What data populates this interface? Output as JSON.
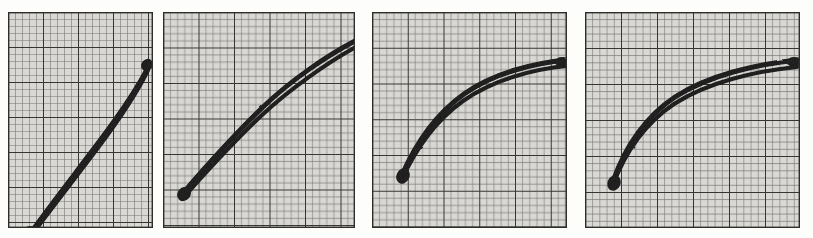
{
  "figure": {
    "title": "",
    "canvas": {
      "width": 813,
      "height": 238
    },
    "background_color": "#fdfdfc",
    "panel_count": 4,
    "ink_color": "#111111",
    "grid_minor_color": "#7c7b77",
    "grid_major_color": "#353431",
    "paper_color": "#d8d7d3"
  },
  "chart_data": {
    "type": "line",
    "title": "",
    "subtitle": "",
    "xlabel": "",
    "ylabel": "",
    "grid": true,
    "legend_position": "none",
    "panels": [
      {
        "index": 1,
        "label": "",
        "xlim": [
          0,
          1
        ],
        "ylim": [
          0,
          1
        ],
        "grid_minor_cells_x": 20,
        "grid_minor_cells_y": 30,
        "grid_major_every": 5,
        "series": [
          {
            "name": "upper",
            "x": [
              0.1,
              0.22,
              0.34,
              0.46,
              0.58,
              0.7,
              0.82,
              0.92
            ],
            "y": [
              0.05,
              0.19,
              0.33,
              0.46,
              0.59,
              0.71,
              0.81,
              0.88
            ]
          },
          {
            "name": "lower",
            "x": [
              0.1,
              0.22,
              0.34,
              0.46,
              0.58,
              0.7,
              0.82,
              0.92
            ],
            "y": [
              0.02,
              0.15,
              0.29,
              0.42,
              0.55,
              0.67,
              0.78,
              0.86
            ]
          }
        ]
      },
      {
        "index": 2,
        "label": "",
        "xlim": [
          0,
          1
        ],
        "ylim": [
          0,
          1
        ],
        "grid_minor_cells_x": 27,
        "grid_minor_cells_y": 30,
        "grid_major_every": 5,
        "series": [
          {
            "name": "upper",
            "x": [
              0.1,
              0.22,
              0.34,
              0.46,
              0.58,
              0.72,
              0.86,
              0.98
            ],
            "y": [
              0.12,
              0.28,
              0.43,
              0.57,
              0.69,
              0.8,
              0.88,
              0.93
            ]
          },
          {
            "name": "lower",
            "x": [
              0.1,
              0.22,
              0.34,
              0.46,
              0.58,
              0.72,
              0.86,
              0.98
            ],
            "y": [
              0.09,
              0.24,
              0.39,
              0.53,
              0.65,
              0.76,
              0.85,
              0.91
            ]
          }
        ]
      },
      {
        "index": 3,
        "label": "",
        "xlim": [
          0,
          1
        ],
        "ylim": [
          0,
          1
        ],
        "grid_minor_cells_x": 27,
        "grid_minor_cells_y": 30,
        "grid_major_every": 5,
        "series": [
          {
            "name": "upper",
            "x": [
              0.14,
              0.25,
              0.36,
              0.48,
              0.6,
              0.74,
              0.88,
              1.0
            ],
            "y": [
              0.26,
              0.44,
              0.58,
              0.69,
              0.76,
              0.81,
              0.84,
              0.85
            ]
          },
          {
            "name": "lower",
            "x": [
              0.14,
              0.25,
              0.36,
              0.48,
              0.6,
              0.74,
              0.88,
              1.0
            ],
            "y": [
              0.22,
              0.39,
              0.53,
              0.65,
              0.73,
              0.78,
              0.82,
              0.84
            ]
          }
        ]
      },
      {
        "index": 4,
        "label": "",
        "xlim": [
          0,
          1
        ],
        "ylim": [
          0,
          1
        ],
        "grid_minor_cells_x": 30,
        "grid_minor_cells_y": 30,
        "grid_major_every": 5,
        "series": [
          {
            "name": "upper",
            "x": [
              0.12,
              0.22,
              0.32,
              0.44,
              0.58,
              0.72,
              0.86,
              0.99
            ],
            "y": [
              0.24,
              0.45,
              0.6,
              0.71,
              0.79,
              0.84,
              0.87,
              0.89
            ]
          },
          {
            "name": "lower",
            "x": [
              0.12,
              0.22,
              0.32,
              0.44,
              0.58,
              0.72,
              0.86,
              0.99
            ],
            "y": [
              0.2,
              0.4,
              0.55,
              0.67,
              0.76,
              0.82,
              0.85,
              0.87
            ]
          }
        ]
      }
    ]
  },
  "panels": [
    {
      "name": "panel-1",
      "left": 8,
      "top": 12,
      "width": 145,
      "height": 216,
      "minor": 7.0,
      "curve_upper": "M 21 223 L 43 193 L 66 163 L 90 131 L 113 99 L 131 72 L 141 53",
      "curve_lower": "M 20 228 L 42 199 L 65 169 L 89 137 L 112 105 L 130 78 L 140 57"
    },
    {
      "name": "panel-2",
      "left": 163,
      "top": 12,
      "width": 192,
      "height": 216,
      "minor": 7.1,
      "curve_upper": "M 20 180 L 45 151 L 70 124 L 96 99 L 122 76 L 150 56 L 178 41 L 192 33",
      "curve_lower": "M 19 186 L 44 158 L 69 132 L 95 107 L 121 84 L 149 64 L 177 47 L 191 38"
    },
    {
      "name": "panel-3",
      "left": 372,
      "top": 12,
      "width": 195,
      "height": 216,
      "minor": 7.1,
      "curve_upper": "M 29 164 L 50 128 L 72 101 L 96 80 L 119 66 L 146 56 L 173 51 L 195 49"
    },
    {
      "name": "panel-4",
      "left": 585,
      "top": 12,
      "width": 215,
      "height": 216,
      "minor": 7.2,
      "curve_upper": "M 27 170 L 47 133 L 69 107 L 95 85 L 125 69 L 156 60 L 186 55 L 213 52"
    }
  ]
}
